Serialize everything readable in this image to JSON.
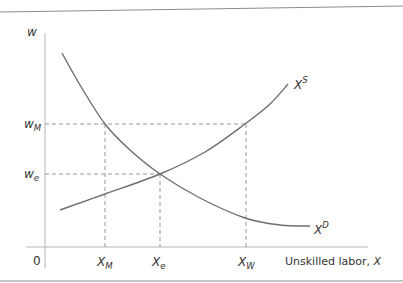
{
  "chart_data": {
    "type": "line",
    "title": "",
    "xlabel": "Unskilled labor, X",
    "ylabel": "w",
    "origin_label": "0",
    "series": [
      {
        "name": "X^D",
        "label_main": "X",
        "label_sup": "D",
        "description": "Demand for unskilled labor (downward sloping)",
        "points": [
          [
            62,
            53
          ],
          [
            80,
            85
          ],
          [
            105,
            124
          ],
          [
            130,
            150
          ],
          [
            160,
            174
          ],
          [
            200,
            198
          ],
          [
            245,
            218
          ],
          [
            280,
            225
          ],
          [
            310,
            226
          ]
        ]
      },
      {
        "name": "X^S",
        "label_main": "X",
        "label_sup": "S",
        "description": "Supply of unskilled labor (upward sloping)",
        "points": [
          [
            60,
            210
          ],
          [
            105,
            194
          ],
          [
            160,
            174
          ],
          [
            205,
            152
          ],
          [
            245,
            124
          ],
          [
            270,
            104
          ],
          [
            288,
            84
          ]
        ]
      }
    ],
    "y_ticks": [
      {
        "main": "w",
        "sub": "M",
        "y": 124
      },
      {
        "main": "w",
        "sub": "e",
        "y": 174
      }
    ],
    "x_ticks": [
      {
        "main": "X",
        "sub": "M",
        "x": 105
      },
      {
        "main": "X",
        "sub": "e",
        "x": 160
      },
      {
        "main": "X",
        "sub": "W",
        "x": 246
      }
    ],
    "guides": [
      {
        "from": [
          45,
          124
        ],
        "to": [
          246,
          124
        ],
        "style": "dashed"
      },
      {
        "from": [
          45,
          174
        ],
        "to": [
          160,
          174
        ],
        "style": "dashed"
      },
      {
        "from": [
          105,
          124
        ],
        "to": [
          105,
          247
        ],
        "style": "dashed"
      },
      {
        "from": [
          160,
          174
        ],
        "to": [
          160,
          247
        ],
        "style": "dashed"
      },
      {
        "from": [
          246,
          124
        ],
        "to": [
          246,
          247
        ],
        "style": "dashed"
      }
    ],
    "equilibrium": {
      "x_label": "X_e",
      "w_label": "w_e"
    },
    "grid": false,
    "legend": "none"
  },
  "colors": {
    "curve": "#6e6e6e",
    "axis": "#b5b5b5",
    "guide": "#8a8a8a",
    "text": "#333333",
    "border": "#8c8c8c"
  }
}
